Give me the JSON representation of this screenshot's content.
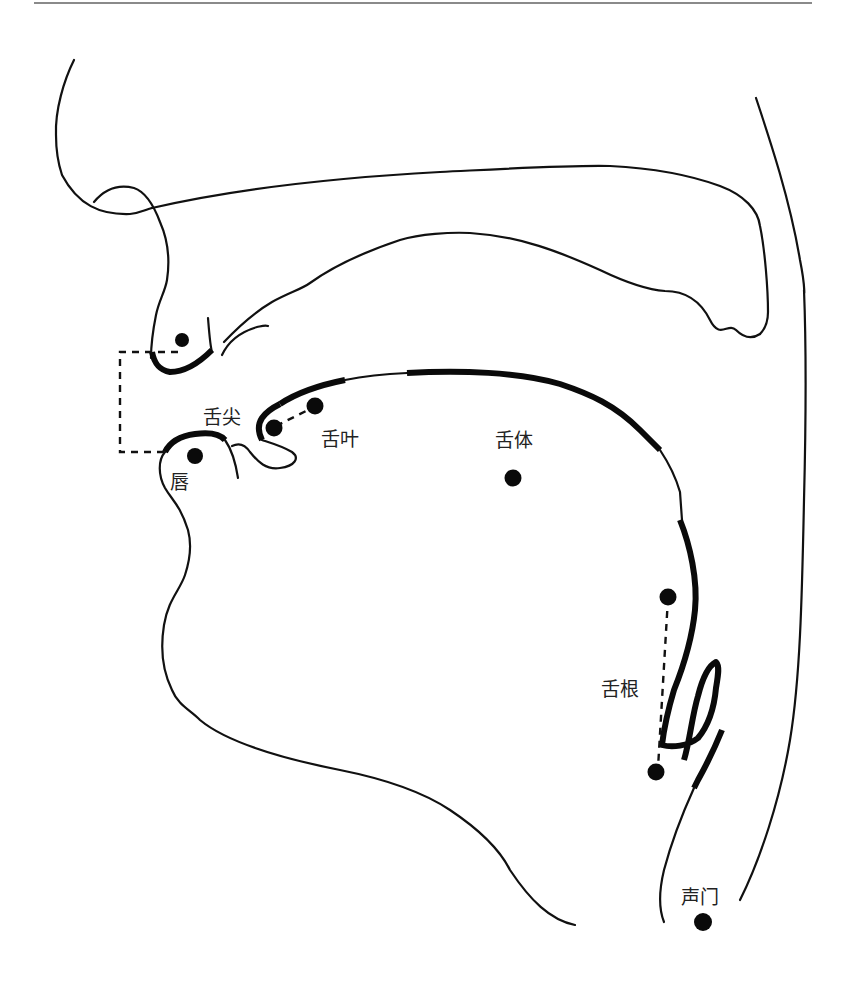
{
  "figure": {
    "labels": {
      "tongue_tip": "舌尖",
      "tongue_blade": "舌叶",
      "tongue_body": "舌体",
      "lips": "唇",
      "tongue_root": "舌根",
      "glottis": "声门"
    },
    "colors": {
      "line": "#111111",
      "rule": "#8a8a8a",
      "background": "#ffffff"
    }
  }
}
